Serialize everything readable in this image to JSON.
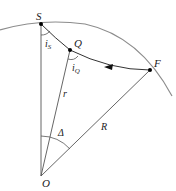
{
  "diagram": {
    "type": "geometry",
    "points": {
      "S": {
        "label": "S",
        "x": 41,
        "y": 24
      },
      "Q": {
        "label": "Q",
        "x": 70,
        "y": 50
      },
      "F": {
        "label": "F",
        "x": 150,
        "y": 70
      },
      "O": {
        "label": "O",
        "x": 41,
        "y": 176
      }
    },
    "labels": {
      "S": "S",
      "Q": "Q",
      "F": "F",
      "O": "O",
      "i_s_main": "i",
      "i_s_sub": "S",
      "i_q_main": "i",
      "i_q_sub": "Q",
      "r": "r",
      "R": "R",
      "delta": "Δ"
    },
    "colors": {
      "arc": "#8c8c8c",
      "line": "#555555",
      "path": "#333333",
      "point": "#000000"
    }
  }
}
